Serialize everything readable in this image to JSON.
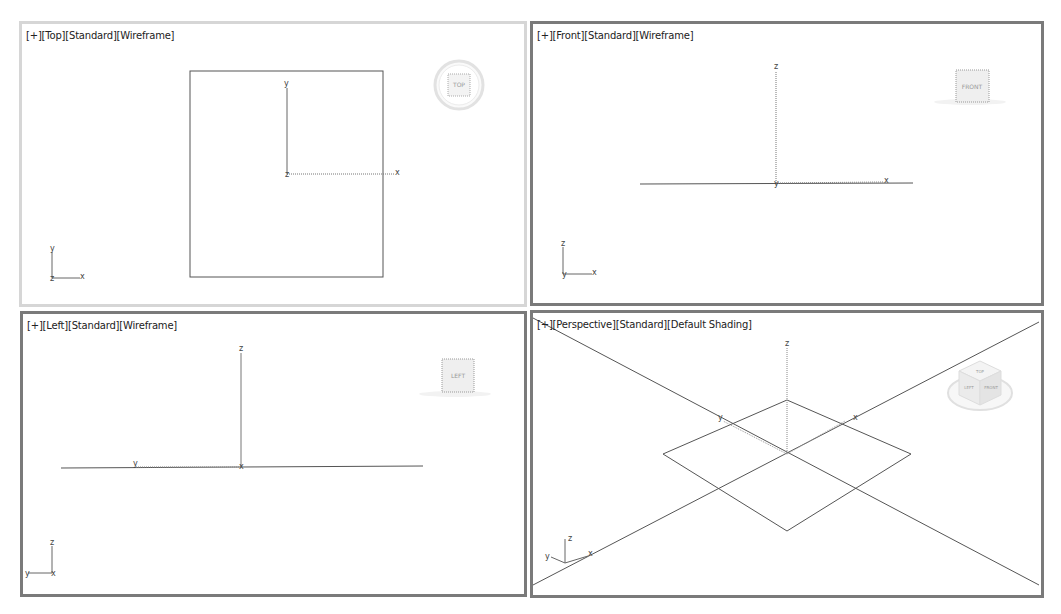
{
  "viewports": {
    "top": {
      "label": {
        "plus": "[+]",
        "view": "[Top]",
        "render_mode": "[Standard]",
        "shading": "[Wireframe]"
      },
      "viewcube_label": "TOP",
      "axes": {
        "x": "x",
        "y": "y",
        "z": "z"
      },
      "active": true
    },
    "front": {
      "label": {
        "plus": "[+]",
        "view": "[Front]",
        "render_mode": "[Standard]",
        "shading": "[Wireframe]"
      },
      "viewcube_label": "FRONT",
      "axes": {
        "x": "x",
        "y": "y",
        "z": "z"
      },
      "active": false
    },
    "left": {
      "label": {
        "plus": "[+]",
        "view": "[Left]",
        "render_mode": "[Standard]",
        "shading": "[Wireframe]"
      },
      "viewcube_label": "LEFT",
      "axes": {
        "x": "x",
        "y": "y",
        "z": "z"
      },
      "active": false
    },
    "perspective": {
      "label": {
        "plus": "[+]",
        "view": "[Perspective]",
        "render_mode": "[Standard]",
        "shading": "[Default Shading]"
      },
      "viewcube_faces": {
        "left": "LEFT",
        "front": "FRONT",
        "top": "TOP"
      },
      "axes": {
        "x": "x",
        "y": "y",
        "z": "z"
      },
      "active": false
    }
  },
  "colors": {
    "active_border": "#d6d6d6",
    "inactive_border": "#7a7a7a",
    "geometry": "#555555",
    "background": "#ffffff"
  }
}
